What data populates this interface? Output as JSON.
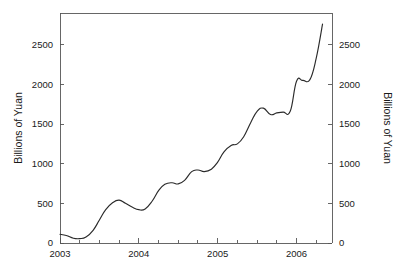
{
  "chart_data": {
    "type": "line",
    "title": "",
    "subtitle": "",
    "xlabel": "",
    "ylabel": "Billions of Yuan",
    "ylabel_right": "Billions of Yuan",
    "xlim": [
      2003.0,
      2006.45
    ],
    "ylim": [
      0,
      2900
    ],
    "grid": false,
    "legend": null,
    "x_tick_labels": [
      "2003",
      "2004",
      "2005",
      "2006"
    ],
    "x_major_ticks": [
      2003,
      2004,
      2005,
      2006
    ],
    "x_minor_ticks": [
      2003.25,
      2003.5,
      2003.75,
      2004.25,
      2004.5,
      2004.75,
      2005.25,
      2005.5,
      2005.75,
      2006.25
    ],
    "y_tick_labels": [
      "0",
      "500",
      "1000",
      "1500",
      "2000",
      "2500"
    ],
    "y_ticks": [
      0,
      500,
      1000,
      1500,
      2000,
      2500
    ],
    "series": [
      {
        "name": "Billions of Yuan",
        "color": "#2b2b2b",
        "x": [
          2003.0,
          2003.08,
          2003.17,
          2003.25,
          2003.33,
          2003.42,
          2003.5,
          2003.58,
          2003.67,
          2003.75,
          2003.83,
          2003.92,
          2004.0,
          2004.08,
          2004.17,
          2004.25,
          2004.33,
          2004.42,
          2004.5,
          2004.58,
          2004.67,
          2004.75,
          2004.83,
          2004.92,
          2005.0,
          2005.08,
          2005.17,
          2005.25,
          2005.33,
          2005.42,
          2005.5,
          2005.58,
          2005.67,
          2005.75,
          2005.83,
          2005.92,
          2006.0,
          2006.08,
          2006.17,
          2006.25,
          2006.33
        ],
        "y": [
          110,
          95,
          60,
          55,
          75,
          160,
          290,
          420,
          510,
          540,
          500,
          450,
          420,
          430,
          530,
          660,
          740,
          760,
          745,
          790,
          900,
          920,
          900,
          930,
          1020,
          1150,
          1230,
          1250,
          1340,
          1520,
          1660,
          1700,
          1620,
          1640,
          1650,
          1660,
          2040,
          2050,
          2060,
          2330,
          2760
        ]
      }
    ]
  },
  "plot_geometry": {
    "left": 60,
    "right": 332,
    "top": 13,
    "bottom": 243
  }
}
